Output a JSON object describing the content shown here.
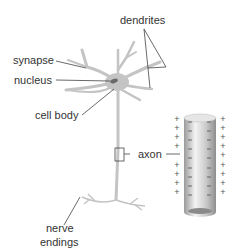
{
  "diagram": {
    "labels": {
      "dendrites": "dendrites",
      "synapse": "synapse",
      "nucleus": "nucleus",
      "cell_body": "cell body",
      "axon": "axon",
      "nerve_endings_line1": "nerve",
      "nerve_endings_line2": "endings"
    },
    "membrane_charges": {
      "outside": "+",
      "inside": "−"
    },
    "colors": {
      "neuron": "#c4c4c4",
      "nucleus": "#6a6a6a",
      "text": "#333333",
      "leader": "#444444",
      "axon_tube_light": "#f2f2f2",
      "axon_tube_dark": "#9a9a9a"
    }
  }
}
